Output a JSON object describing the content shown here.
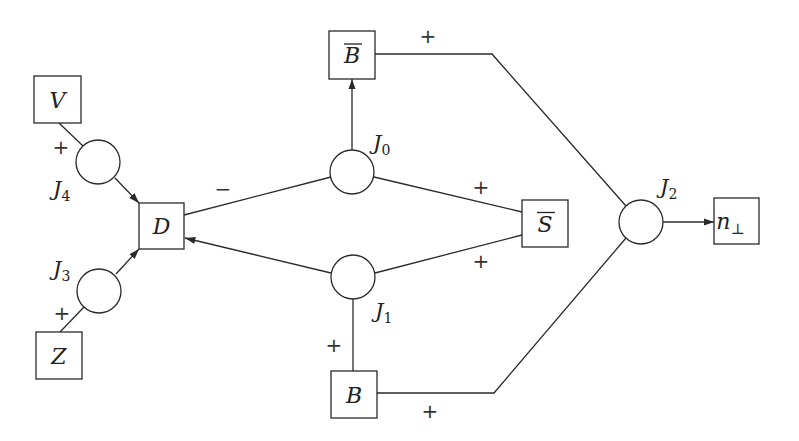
{
  "diagram": {
    "title": "",
    "stroke_color": "#2a2a2a",
    "background": "#ffffff",
    "boxes": [
      {
        "id": "V",
        "label": "V",
        "overline": false,
        "x": 34,
        "y": 76,
        "w": 47,
        "h": 47
      },
      {
        "id": "Z",
        "label": "Z",
        "overline": false,
        "x": 36,
        "y": 332,
        "w": 46,
        "h": 47
      },
      {
        "id": "D",
        "label": "D",
        "overline": false,
        "x": 139,
        "y": 203,
        "w": 45,
        "h": 46
      },
      {
        "id": "Bbar",
        "label": "B",
        "overline": true,
        "x": 329,
        "y": 31,
        "w": 46,
        "h": 48
      },
      {
        "id": "B",
        "label": "B",
        "overline": false,
        "x": 331,
        "y": 371,
        "w": 46,
        "h": 47
      },
      {
        "id": "Sbar",
        "label": "S",
        "overline": true,
        "x": 522,
        "y": 200,
        "w": 46,
        "h": 47
      },
      {
        "id": "nperp",
        "label": "n",
        "sub": "⊥",
        "overline": false,
        "x": 714,
        "y": 198,
        "w": 45,
        "h": 46
      }
    ],
    "junctions": [
      {
        "id": "J0",
        "label": "J",
        "sub": "0",
        "cx": 352,
        "cy": 172,
        "r": 22,
        "lx": 373,
        "ly": 150
      },
      {
        "id": "J1",
        "label": "J",
        "sub": "1",
        "cx": 353,
        "cy": 277,
        "r": 22,
        "lx": 375,
        "ly": 318
      },
      {
        "id": "J2",
        "label": "J",
        "sub": "2",
        "cx": 641,
        "cy": 222,
        "r": 22,
        "lx": 660,
        "ly": 194
      },
      {
        "id": "J3",
        "label": "J",
        "sub": "3",
        "cx": 99,
        "cy": 291,
        "r": 22,
        "lx": 53,
        "ly": 276
      },
      {
        "id": "J4",
        "label": "J",
        "sub": "4",
        "cx": 98,
        "cy": 162,
        "r": 22,
        "lx": 53,
        "ly": 196
      }
    ],
    "edges": [
      {
        "from": "V",
        "to": "J4",
        "points": [
          [
            59,
            123
          ],
          [
            83,
            146
          ]
        ],
        "arrow": false
      },
      {
        "from": "J4",
        "to": "D",
        "points": [
          [
            115,
            178
          ],
          [
            139,
            203
          ]
        ],
        "arrow": true
      },
      {
        "from": "Z",
        "to": "J3",
        "points": [
          [
            60,
            332
          ],
          [
            84,
            307
          ]
        ],
        "arrow": false
      },
      {
        "from": "J3",
        "to": "D",
        "points": [
          [
            116,
            274
          ],
          [
            139,
            249
          ]
        ],
        "arrow": true
      },
      {
        "from": "D",
        "to": "J0",
        "points": [
          [
            184,
            215
          ],
          [
            331,
            177
          ]
        ],
        "arrow": false
      },
      {
        "from": "J1",
        "to": "D",
        "points": [
          [
            331,
            273
          ],
          [
            185,
            238
          ]
        ],
        "arrow": true
      },
      {
        "from": "J0",
        "to": "Bbar",
        "points": [
          [
            352,
            150
          ],
          [
            352,
            79
          ]
        ],
        "arrow": true
      },
      {
        "from": "J0",
        "to": "Sbar",
        "points": [
          [
            374,
            177
          ],
          [
            522,
            212
          ]
        ],
        "arrow": false
      },
      {
        "from": "J1",
        "to": "Sbar",
        "points": [
          [
            375,
            273
          ],
          [
            522,
            235
          ]
        ],
        "arrow": false
      },
      {
        "from": "B",
        "to": "J1",
        "points": [
          [
            353,
            371
          ],
          [
            353,
            299
          ]
        ],
        "arrow": false
      },
      {
        "from": "Bbar",
        "to": "J2",
        "points": [
          [
            375,
            54
          ],
          [
            492,
            54
          ],
          [
            626,
            206
          ]
        ],
        "arrow": false
      },
      {
        "from": "B",
        "to": "J2",
        "points": [
          [
            377,
            393
          ],
          [
            494,
            393
          ],
          [
            626,
            238
          ]
        ],
        "arrow": false
      },
      {
        "from": "J2",
        "to": "nperp",
        "points": [
          [
            663,
            222
          ],
          [
            714,
            222
          ]
        ],
        "arrow": true
      }
    ],
    "signs": [
      {
        "text": "+",
        "x": 61,
        "y": 154
      },
      {
        "text": "+",
        "x": 62,
        "y": 320
      },
      {
        "text": "−",
        "x": 223,
        "y": 196
      },
      {
        "text": "+",
        "x": 428,
        "y": 43
      },
      {
        "text": "+",
        "x": 481,
        "y": 194
      },
      {
        "text": "+",
        "x": 481,
        "y": 268
      },
      {
        "text": "+",
        "x": 334,
        "y": 352
      },
      {
        "text": "+",
        "x": 430,
        "y": 418
      }
    ]
  }
}
